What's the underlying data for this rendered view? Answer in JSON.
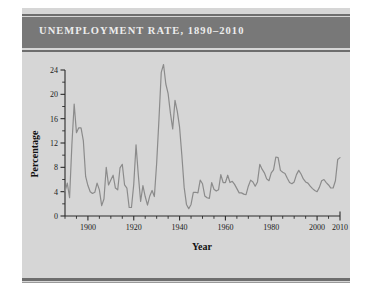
{
  "banner": {
    "title": "UNEMPLOYMENT RATE, 1890–2010",
    "background_color": "#787878",
    "text_color": "#ededed"
  },
  "page": {
    "background_color": "#ffffff",
    "panel_color": "#d6d6d6",
    "rule_color": "#6e6e6e"
  },
  "chart_data": {
    "type": "line",
    "title": "UNEMPLOYMENT RATE, 1890–2010",
    "xlabel": "Year",
    "ylabel": "Percentage",
    "xlim": [
      1890,
      2010
    ],
    "ylim": [
      0,
      24
    ],
    "grid": false,
    "legend": null,
    "line_color": "#8b8b8b",
    "x_ticks_major": [
      1900,
      1920,
      1940,
      1960,
      1980,
      2000,
      2010
    ],
    "x_tick_labels": [
      "1900",
      "1920",
      "1940",
      "1960",
      "1980",
      "2000",
      "2010"
    ],
    "x_tick_minor_step": 5,
    "y_ticks_major": [
      0,
      4,
      8,
      12,
      16,
      20,
      24
    ],
    "y_tick_labels": [
      "0",
      "4",
      "8",
      "12",
      "16",
      "20",
      "24"
    ],
    "y_tick_minor_step": 2,
    "series": [
      {
        "name": "Unemployment rate",
        "x": [
          1890,
          1891,
          1892,
          1893,
          1894,
          1895,
          1896,
          1897,
          1898,
          1899,
          1900,
          1901,
          1902,
          1903,
          1904,
          1905,
          1906,
          1907,
          1908,
          1909,
          1910,
          1911,
          1912,
          1913,
          1914,
          1915,
          1916,
          1917,
          1918,
          1919,
          1920,
          1921,
          1922,
          1923,
          1924,
          1925,
          1926,
          1927,
          1928,
          1929,
          1930,
          1931,
          1932,
          1933,
          1934,
          1935,
          1936,
          1937,
          1938,
          1939,
          1940,
          1941,
          1942,
          1943,
          1944,
          1945,
          1946,
          1947,
          1948,
          1949,
          1950,
          1951,
          1952,
          1953,
          1954,
          1955,
          1956,
          1957,
          1958,
          1959,
          1960,
          1961,
          1962,
          1963,
          1964,
          1965,
          1966,
          1967,
          1968,
          1969,
          1970,
          1971,
          1972,
          1973,
          1974,
          1975,
          1976,
          1977,
          1978,
          1979,
          1980,
          1981,
          1982,
          1983,
          1984,
          1985,
          1986,
          1987,
          1988,
          1989,
          1990,
          1991,
          1992,
          1993,
          1994,
          1995,
          1996,
          1997,
          1998,
          1999,
          2000,
          2001,
          2002,
          2003,
          2004,
          2005,
          2006,
          2007,
          2008,
          2009,
          2010
        ],
        "values": [
          4.0,
          5.4,
          3.0,
          11.7,
          18.4,
          13.7,
          14.5,
          14.5,
          12.4,
          6.5,
          5.0,
          4.0,
          3.7,
          3.9,
          5.4,
          4.3,
          1.7,
          2.8,
          8.0,
          5.1,
          5.9,
          6.7,
          4.6,
          4.3,
          7.9,
          8.5,
          5.1,
          4.6,
          1.4,
          1.4,
          5.2,
          11.7,
          6.7,
          2.4,
          5.0,
          3.2,
          1.8,
          3.3,
          4.2,
          3.2,
          8.7,
          15.9,
          23.6,
          24.9,
          21.7,
          20.1,
          16.9,
          14.3,
          19.0,
          17.2,
          14.6,
          9.9,
          4.7,
          1.9,
          1.2,
          1.9,
          3.9,
          3.9,
          3.8,
          5.9,
          5.3,
          3.3,
          3.0,
          2.9,
          5.5,
          4.4,
          4.1,
          4.3,
          6.8,
          5.5,
          5.5,
          6.7,
          5.5,
          5.7,
          5.2,
          4.5,
          3.8,
          3.8,
          3.6,
          3.5,
          4.9,
          5.9,
          5.6,
          4.9,
          5.6,
          8.5,
          7.7,
          7.1,
          6.1,
          5.8,
          7.1,
          7.6,
          9.7,
          9.6,
          7.5,
          7.2,
          7.0,
          6.2,
          5.5,
          5.3,
          5.6,
          6.8,
          7.5,
          6.9,
          6.1,
          5.6,
          5.4,
          4.9,
          4.5,
          4.2,
          4.0,
          4.7,
          5.8,
          6.0,
          5.5,
          5.1,
          4.6,
          4.6,
          5.8,
          9.3,
          9.6
        ]
      }
    ]
  }
}
